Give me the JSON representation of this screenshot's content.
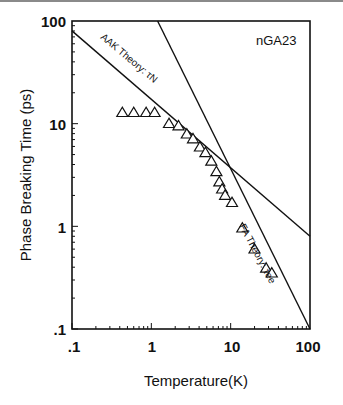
{
  "chart_data": {
    "type": "scatter",
    "title": "",
    "xlabel": "Temperature(K)",
    "ylabel": "Phase Breaking Time (ps)",
    "xscale": "log",
    "yscale": "log",
    "xlim": [
      0.1,
      100
    ],
    "ylim": [
      0.1,
      100
    ],
    "xticks": [
      ".1",
      "1",
      "10",
      "100"
    ],
    "yticks": [
      ".1",
      "1",
      "10",
      "100"
    ],
    "grid": false,
    "legend": null,
    "sample_label": "nGA23",
    "series": [
      {
        "name": "Measured data",
        "marker": "open-triangle",
        "x": [
          0.43,
          0.6,
          0.86,
          1.1,
          1.67,
          2.2,
          2.8,
          3.35,
          4.1,
          4.8,
          5.7,
          6.6,
          7.2,
          7.8,
          8.5,
          10.4,
          14,
          20,
          28,
          33
        ],
        "y": [
          12.8,
          12.8,
          12.8,
          12.8,
          10,
          9.5,
          7.9,
          7.1,
          5.9,
          5.2,
          4.3,
          3.4,
          2.7,
          2.3,
          2.0,
          1.7,
          0.96,
          0.6,
          0.39,
          0.35
        ]
      },
      {
        "name": "AAK Theory: τN",
        "type": "line",
        "x": [
          0.1,
          100
        ],
        "y": [
          80,
          0.8
        ]
      },
      {
        "name": "FA Theory: τee",
        "type": "line",
        "x": [
          1.2,
          100
        ],
        "y": [
          100,
          0.1
        ]
      }
    ],
    "annotations": [
      {
        "text": "AAK Theory: τN",
        "near_x": 0.5,
        "near_y": 40
      },
      {
        "text": "FA Theory: τee",
        "near_x": 25,
        "near_y": 1.0
      },
      {
        "text": "nGA23",
        "near_x": 40,
        "near_y": 70
      }
    ]
  },
  "labels": {
    "xlabel": "Temperature(K)",
    "ylabel": "Phase Breaking Time (ps)",
    "sample": "nGA23",
    "aak": "AAK Theory: τN",
    "fa": "FA Theory: τee",
    "xticks": [
      ".1",
      "1",
      "10",
      "100"
    ],
    "yticks": [
      ".1",
      "1",
      "10",
      "100"
    ]
  }
}
